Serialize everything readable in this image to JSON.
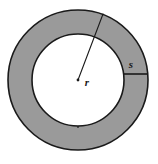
{
  "figure": {
    "name": "annulus-diagram",
    "type": "geometry-diagram",
    "background_color": "#ffffff",
    "shape": {
      "name": "annulus",
      "fill_color": "#9a9a9a",
      "stroke_color": "#1a1a1a",
      "stroke_width": 1.6,
      "center_x": 78,
      "center_y": 80,
      "outer_radius": 70,
      "inner_radius": 46
    },
    "center_dot": {
      "name": "center-point",
      "x": 78,
      "y": 80,
      "radius": 1.4,
      "color": "#1a1a1a"
    },
    "radius_line": {
      "name": "radius-line",
      "x1": 78,
      "y1": 80,
      "x2": 103,
      "y2": 14,
      "stroke_color": "#1a1a1a",
      "stroke_width": 1.1
    },
    "width_tick_line": {
      "name": "ring-width-tick",
      "x1": 124,
      "y1": 74,
      "x2": 148,
      "y2": 74,
      "stroke_color": "#1a1a1a",
      "stroke_width": 1.6
    },
    "inner_tick_line": {
      "name": "inner-circle-tick",
      "x1": 78,
      "y1": 126,
      "x2": 78,
      "y2": 128,
      "stroke_color": "#1a1a1a",
      "stroke_width": 1.2
    },
    "labels": [
      {
        "name": "radius-label",
        "text": "r",
        "x": 87,
        "y": 86,
        "style": "italic-serif"
      },
      {
        "name": "ring-width-label",
        "text": "s",
        "x": 131,
        "y": 68,
        "style": "italic-serif"
      }
    ]
  }
}
